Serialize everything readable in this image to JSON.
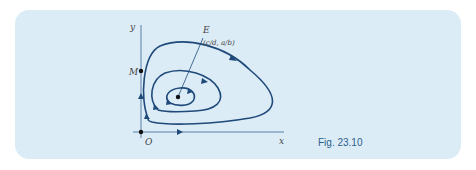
{
  "figure": {
    "caption": "Fig. 23.10",
    "labels": {
      "y_axis": "y",
      "x_axis": "x",
      "origin": "O",
      "point_m": "M",
      "equilibrium": "E",
      "equilibrium_coords": "(c/d, a/b)"
    },
    "colors": {
      "panel": "#dcecf7",
      "curve": "#1f4a7a",
      "axis": "#5a7fa6",
      "caption": "#2a5e8a"
    }
  }
}
